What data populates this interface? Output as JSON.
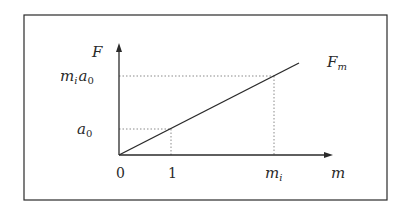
{
  "diagram": {
    "type": "linear-force-vs-mass",
    "colors": {
      "background": "#ffffff",
      "ink": "#2a2a2a",
      "guide": "#8a8a8a"
    },
    "axes": {
      "y_label": "F",
      "x_label": "m"
    },
    "y_ticks": [
      {
        "base": "m",
        "sub": "i",
        "base2": "a",
        "sub2": "0",
        "text": "m_i a_0"
      },
      {
        "base": "a",
        "sub": "0",
        "text": "a_0"
      }
    ],
    "x_ticks": [
      {
        "text": "0"
      },
      {
        "text": "1"
      },
      {
        "base": "m",
        "sub": "i",
        "text": "m_i"
      }
    ],
    "line_label": {
      "base": "F",
      "sub": "m",
      "text": "F_m"
    }
  }
}
